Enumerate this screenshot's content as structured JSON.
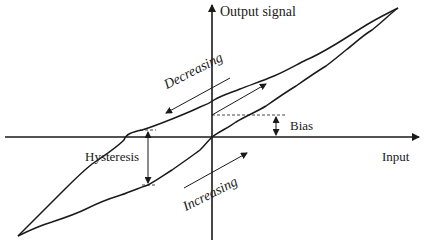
{
  "diagram": {
    "axes": {
      "x_label": "Input",
      "y_label": "Output signal"
    },
    "labels": {
      "decreasing": "Decreasing",
      "increasing": "Increasing",
      "bias": "Bias",
      "hysteresis": "Hysteresis"
    },
    "colors": {
      "stroke": "#1a1a1a",
      "background": "#ffffff"
    },
    "elements": [
      {
        "type": "axis",
        "name": "output-axis",
        "direction": "vertical",
        "arrow": "up"
      },
      {
        "type": "axis",
        "name": "input-axis",
        "direction": "horizontal",
        "arrow": "right"
      },
      {
        "type": "curve",
        "name": "decreasing-curve",
        "description": "upper branch of hysteresis loop"
      },
      {
        "type": "curve",
        "name": "increasing-curve",
        "description": "lower branch passing through origin"
      },
      {
        "type": "arrow",
        "name": "decreasing-direction-arrow",
        "direction": "down-left"
      },
      {
        "type": "arrow",
        "name": "increasing-direction-arrow",
        "direction": "up-right"
      },
      {
        "type": "arrow",
        "name": "ideal-line-arrow",
        "direction": "up-right"
      },
      {
        "type": "dimension",
        "name": "bias-dimension",
        "description": "offset between origin and dashed line"
      },
      {
        "type": "dimension",
        "name": "hysteresis-dimension",
        "description": "vertical gap between branches"
      }
    ]
  }
}
